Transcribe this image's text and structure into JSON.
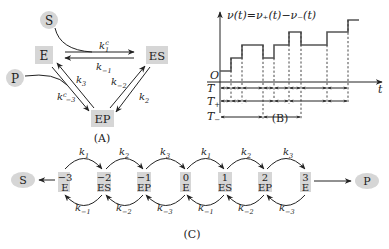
{
  "panelA": {
    "caption": "(A)",
    "nodes": {
      "S": "S",
      "E": "E",
      "ES": "ES",
      "P": "P",
      "EP": "EP"
    },
    "rates": {
      "k1c": {
        "base": "k",
        "sub": "1",
        "sup": "c"
      },
      "km1": {
        "base": "k",
        "sub": "−1"
      },
      "k3": {
        "base": "k",
        "sub": "3"
      },
      "km3c": {
        "base": "k",
        "sub": "−3",
        "sup": "c"
      },
      "km2": {
        "base": "k",
        "sub": "−2"
      },
      "k2": {
        "base": "k",
        "sub": "2"
      }
    }
  },
  "panelB": {
    "caption": "(B)",
    "title": "ν(t)=ν₊(t)−ν₋(t)",
    "origin_label": "O",
    "x_axis_label": "t",
    "rows": [
      {
        "label": "T",
        "sub": ""
      },
      {
        "label": "T",
        "sub": "+"
      },
      {
        "label": "T",
        "sub": "−"
      }
    ]
  },
  "panelC": {
    "caption": "(C)",
    "start_node": "S",
    "end_node": "P",
    "states": [
      {
        "index": "−3",
        "species": "E"
      },
      {
        "index": "−2",
        "species": "ES"
      },
      {
        "index": "−1",
        "species": "EP"
      },
      {
        "index": "0",
        "species": "E"
      },
      {
        "index": "1",
        "species": "ES"
      },
      {
        "index": "2",
        "species": "EP"
      },
      {
        "index": "3",
        "species": "E"
      }
    ],
    "forward_rates": [
      {
        "base": "k",
        "sub": "1"
      },
      {
        "base": "k",
        "sub": "2"
      },
      {
        "base": "k",
        "sub": "3"
      },
      {
        "base": "k",
        "sub": "1"
      },
      {
        "base": "k",
        "sub": "2"
      },
      {
        "base": "k",
        "sub": "3"
      }
    ],
    "backward_rates": [
      {
        "base": "k",
        "sub": "−1"
      },
      {
        "base": "k",
        "sub": "−2"
      },
      {
        "base": "k",
        "sub": "−3"
      },
      {
        "base": "k",
        "sub": "−1"
      },
      {
        "base": "k",
        "sub": "−2"
      },
      {
        "base": "k",
        "sub": "−3"
      }
    ]
  }
}
